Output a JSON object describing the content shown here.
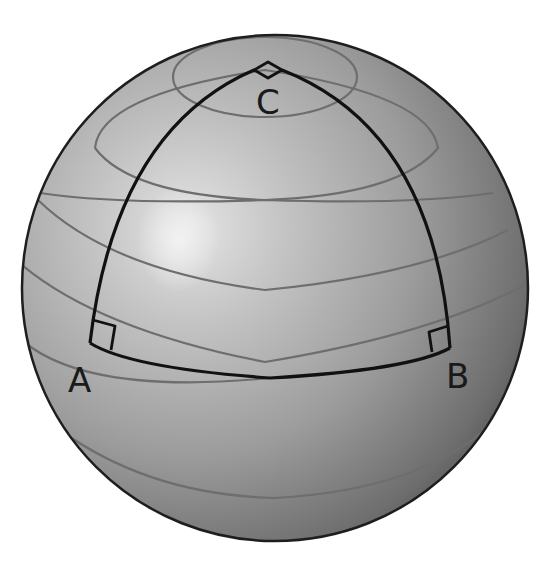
{
  "diagram": {
    "type": "spherical-triangle",
    "vertices": [
      {
        "label": "A",
        "right_angle": true
      },
      {
        "label": "B",
        "right_angle": true
      },
      {
        "label": "C",
        "right_angle": true
      }
    ],
    "edges": [
      {
        "from": "A",
        "to": "B",
        "kind": "equator-arc"
      },
      {
        "from": "A",
        "to": "C",
        "kind": "meridian-arc"
      },
      {
        "from": "B",
        "to": "C",
        "kind": "meridian-arc"
      }
    ],
    "labels": {
      "a": "A",
      "b": "B",
      "c": "C"
    },
    "colors": {
      "sphere_light": "#d8d8d8",
      "sphere_mid": "#a8a8a8",
      "sphere_dark": "#5a5a5a",
      "latitude_line": "#6e6e6e",
      "triangle_line": "#111111",
      "outline": "#1e1e1e"
    }
  }
}
